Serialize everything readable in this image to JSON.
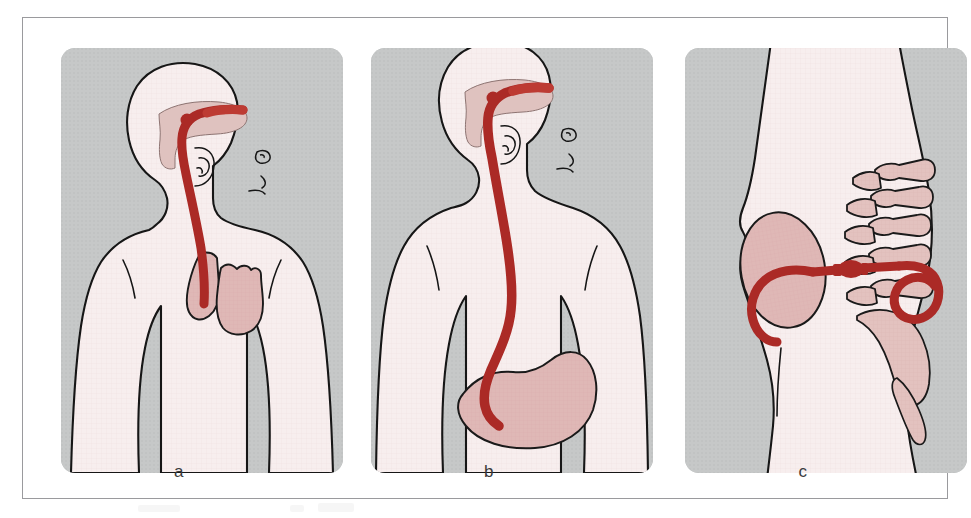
{
  "figure": {
    "kind": "medical-illustration",
    "title_visible": false,
    "panel_count": 3
  },
  "colors": {
    "page_background": "#ffffff",
    "frame_border": "#9a9a9d",
    "panel_background_gray": "#c6c8c8",
    "body_fill_pink": "#f7eeee",
    "body_outline": "#161616",
    "organ_fill": "#dfb8b6",
    "organ_outline": "#1a1a1a",
    "catheter_red": "#ab2a26",
    "catheter_red_light": "#bd3b33",
    "bone_fill": "#e3c2bf",
    "label_text": "#3a3a3c"
  },
  "panels": [
    {
      "id": "a",
      "label": "a",
      "view": "anterior upper body",
      "description": "Nasogastric tube inserted through the nose, passing down the pharynx and stopping in the upper/mid oesophagus above the stomach; heart shown in chest.",
      "structures": [
        "head and neck silhouette",
        "nasal cavity",
        "ear",
        "shoulders and arms",
        "oesophagus segment",
        "heart",
        "nasogastric catheter (malpositioned, too short)"
      ]
    },
    {
      "id": "b",
      "label": "b",
      "view": "anterior upper body",
      "description": "Nasogastric tube advanced correctly through the nose and oesophagus with the tip lying inside the stomach.",
      "structures": [
        "head and neck silhouette",
        "nasal cavity",
        "ear",
        "shoulders and arms",
        "oesophagus",
        "stomach",
        "nasogastric catheter (correct position, tip in stomach)"
      ]
    },
    {
      "id": "c",
      "label": "c",
      "view": "lateral pelvis",
      "description": "Lateral view of the pelvis showing lumbar vertebrae and sacrum with a urinary catheter entering the bladder and coiling within it.",
      "structures": [
        "lateral trunk and buttock silhouette",
        "urinary bladder",
        "lumbar vertebrae",
        "sacrum",
        "coccyx",
        "urinary catheter with balloon and coiled tip"
      ]
    }
  ],
  "labels": {
    "a": "a",
    "b": "b",
    "c": "c"
  }
}
